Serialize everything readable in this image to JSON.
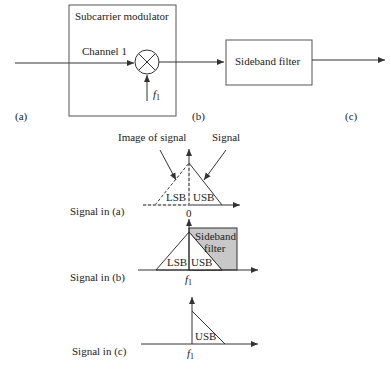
{
  "block_diagram": {
    "modulator": {
      "title": "Subcarrier modulator",
      "input_label": "Channel 1",
      "carrier_label_base": "f",
      "carrier_label_sub": "1"
    },
    "filter": {
      "title": "Sideband filter"
    },
    "points": {
      "a": "(a)",
      "b": "(b)",
      "c": "(c)"
    }
  },
  "spectra": {
    "a": {
      "row_label": "Signal in (a)",
      "origin_label": "0",
      "annotations": {
        "image": "Image of signal",
        "signal": "Signal"
      },
      "lsb": "LSB",
      "usb": "USB"
    },
    "b": {
      "row_label": "Signal in (b)",
      "origin_label_base": "f",
      "origin_label_sub": "1",
      "lsb": "LSB",
      "usb": "USB",
      "filter_line1": "Sideband",
      "filter_line2": "filter"
    },
    "c": {
      "row_label": "Signal in (c)",
      "origin_label_base": "f",
      "origin_label_sub": "1",
      "usb": "USB"
    }
  },
  "colors": {
    "line": "#333333",
    "filter_fill": "#c8c8c8"
  }
}
